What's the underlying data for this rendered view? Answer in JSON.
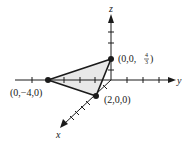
{
  "diagram": {
    "type": "3d-coordinate-plot",
    "axes": {
      "x": {
        "label": "x"
      },
      "y": {
        "label": "y"
      },
      "z": {
        "label": "z"
      }
    },
    "points": [
      {
        "id": "p1",
        "label_text": "(0,0,",
        "frac_num": "4",
        "frac_den": "3",
        "label_close": ")"
      },
      {
        "id": "p2",
        "label": "(0,−4,0)"
      },
      {
        "id": "p3",
        "label": "(2,0,0)"
      }
    ],
    "shape": "triangle",
    "colors": {
      "line": "#1a1a1a",
      "fill": "#e6e6e6"
    }
  }
}
